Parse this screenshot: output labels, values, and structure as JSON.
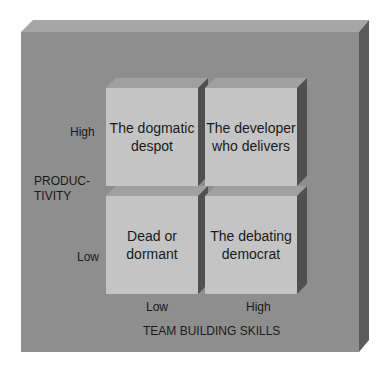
{
  "diagram": {
    "quadrants": [
      {
        "id": "top-left",
        "label_line1": "The dogmatic",
        "label_line2": "despot",
        "productivity": "High",
        "team_building": "Low"
      },
      {
        "id": "top-right",
        "label_line1": "The developer",
        "label_line2": "who delivers",
        "productivity": "High",
        "team_building": "High"
      },
      {
        "id": "bottom-left",
        "label_line1": "Dead or",
        "label_line2": "dormant",
        "productivity": "Low",
        "team_building": "Low"
      },
      {
        "id": "bottom-right",
        "label_line1": "The debating",
        "label_line2": "democrat",
        "productivity": "Low",
        "team_building": "High"
      }
    ],
    "y_axis": {
      "title_line1": "PRODUC-",
      "title_line2": "TIVITY",
      "high": "High",
      "low": "Low"
    },
    "x_axis": {
      "title": "TEAM BUILDING SKILLS",
      "low": "Low",
      "high": "High"
    },
    "colors": {
      "slab": "#8e8e8e",
      "box_face": "#c4c4c4",
      "box_side": "#505050"
    }
  }
}
